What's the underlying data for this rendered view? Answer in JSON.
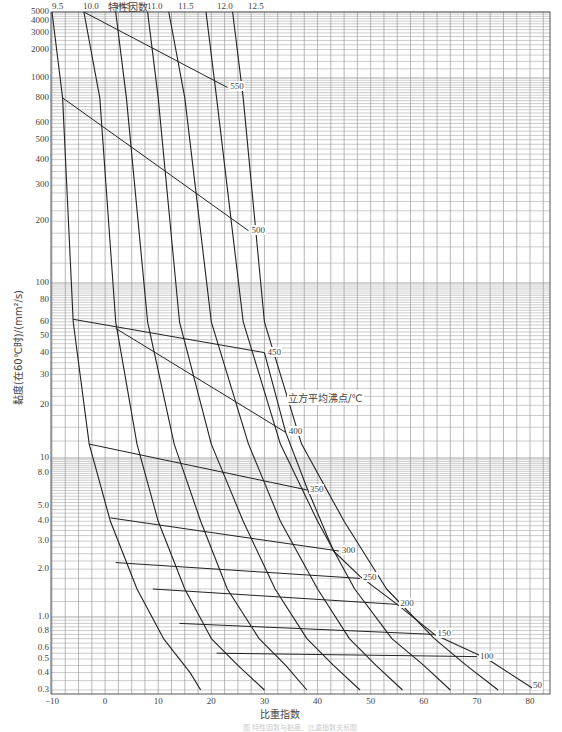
{
  "chart_data": {
    "type": "line",
    "title": "特性因数",
    "xlabel": "比重指数",
    "ylabel": "黏度(在60℃时)/(mm²/s)",
    "legend_title": "立方平均沸点/℃",
    "xlim": [
      -10,
      82
    ],
    "ylim": [
      0.3,
      5000
    ],
    "yscale": "log-log",
    "grid": true,
    "x_ticks": [
      -10,
      0,
      10,
      20,
      30,
      40,
      50,
      60,
      70,
      80
    ],
    "y_ticks": [
      "0.3",
      "0.4",
      "0.5",
      "0.6",
      "0.8",
      "1.0",
      "2.0",
      "3.0",
      "4.0",
      "5.0",
      "8.0",
      "10",
      "20",
      "30",
      "40",
      "50",
      "60",
      "80",
      "100",
      "200",
      "300",
      "400",
      "500",
      "600",
      "800",
      "1000",
      "2000",
      "3000",
      "4000",
      "5000"
    ],
    "top_ticks": [
      "9.5",
      "10.0",
      "10.5",
      "11.0",
      "11.5",
      "12.0",
      "12.5"
    ],
    "series_characterization_factor": [
      {
        "name": "9.5",
        "points": [
          [
            -10,
            5000
          ],
          [
            -8,
            800
          ],
          [
            -6,
            60
          ],
          [
            -3,
            12
          ],
          [
            1,
            4.0
          ],
          [
            6,
            1.5
          ],
          [
            11,
            0.7
          ],
          [
            16,
            0.4
          ],
          [
            18,
            0.3
          ]
        ]
      },
      {
        "name": "10.0",
        "points": [
          [
            -4,
            5000
          ],
          [
            -1,
            800
          ],
          [
            2,
            60
          ],
          [
            6,
            12
          ],
          [
            10,
            4.0
          ],
          [
            15,
            1.5
          ],
          [
            20,
            0.7
          ],
          [
            25,
            0.45
          ],
          [
            30,
            0.3
          ]
        ]
      },
      {
        "name": "10.5",
        "points": [
          [
            2,
            5000
          ],
          [
            4,
            800
          ],
          [
            8,
            60
          ],
          [
            13,
            12
          ],
          [
            18,
            4.0
          ],
          [
            23,
            1.5
          ],
          [
            29,
            0.7
          ],
          [
            34,
            0.45
          ],
          [
            38,
            0.3
          ]
        ]
      },
      {
        "name": "11.0",
        "points": [
          [
            8,
            5000
          ],
          [
            10,
            800
          ],
          [
            14,
            60
          ],
          [
            20,
            12
          ],
          [
            26,
            4.0
          ],
          [
            32,
            1.5
          ],
          [
            38,
            0.7
          ],
          [
            43,
            0.45
          ],
          [
            48,
            0.3
          ]
        ]
      },
      {
        "name": "11.5",
        "points": [
          [
            12,
            5000
          ],
          [
            15,
            800
          ],
          [
            20,
            60
          ],
          [
            27,
            12
          ],
          [
            33,
            4.0
          ],
          [
            40,
            1.5
          ],
          [
            46,
            0.7
          ],
          [
            51,
            0.45
          ],
          [
            56,
            0.3
          ]
        ]
      },
      {
        "name": "12.0",
        "points": [
          [
            19,
            5000
          ],
          [
            21,
            800
          ],
          [
            26,
            60
          ],
          [
            33,
            12
          ],
          [
            40,
            4.0
          ],
          [
            47,
            1.5
          ],
          [
            54,
            0.7
          ],
          [
            60,
            0.45
          ],
          [
            65,
            0.3
          ]
        ]
      },
      {
        "name": "12.5",
        "points": [
          [
            24,
            5000
          ],
          [
            26,
            800
          ],
          [
            30,
            60
          ],
          [
            37,
            12
          ],
          [
            45,
            4.0
          ],
          [
            53,
            1.5
          ],
          [
            62,
            0.7
          ],
          [
            68,
            0.45
          ],
          [
            74,
            0.3
          ]
        ]
      },
      {
        "name": "envelope",
        "points": [
          [
            30,
            40
          ],
          [
            34,
            14
          ],
          [
            38,
            6.5
          ],
          [
            43,
            2.6
          ],
          [
            48,
            1.8
          ],
          [
            55,
            1.2
          ],
          [
            62,
            0.75
          ],
          [
            72,
            0.5
          ],
          [
            81,
            0.3
          ]
        ]
      }
    ],
    "series_boiling_point": [
      {
        "name": "550",
        "points": [
          [
            -4,
            5000
          ],
          [
            23,
            900
          ]
        ]
      },
      {
        "name": "500",
        "points": [
          [
            -8,
            800
          ],
          [
            27,
            180
          ]
        ]
      },
      {
        "name": "450",
        "points": [
          [
            -6,
            62
          ],
          [
            30,
            40
          ]
        ]
      },
      {
        "name": "400",
        "points": [
          [
            2,
            55
          ],
          [
            34,
            14
          ]
        ]
      },
      {
        "name": "350",
        "points": [
          [
            -3,
            12
          ],
          [
            38,
            6.3
          ]
        ]
      },
      {
        "name": "300",
        "points": [
          [
            1,
            4.2
          ],
          [
            44,
            2.6
          ]
        ]
      },
      {
        "name": "250",
        "points": [
          [
            2,
            2.2
          ],
          [
            48,
            1.75
          ]
        ]
      },
      {
        "name": "200",
        "points": [
          [
            9,
            1.5
          ],
          [
            55,
            1.2
          ]
        ]
      },
      {
        "name": "150",
        "points": [
          [
            14,
            0.9
          ],
          [
            62,
            0.75
          ]
        ]
      },
      {
        "name": "100",
        "points": [
          [
            21,
            0.55
          ],
          [
            70,
            0.52
          ]
        ]
      },
      {
        "name": "50",
        "points": [
          [
            80,
            0.32
          ]
        ]
      }
    ]
  },
  "labels": {
    "bp_labels": [
      "550",
      "500",
      "450",
      "400",
      "350",
      "300",
      "250",
      "200",
      "150",
      "100",
      "50"
    ]
  },
  "caption": "图 特性因数与黏度、比重指数关系图"
}
